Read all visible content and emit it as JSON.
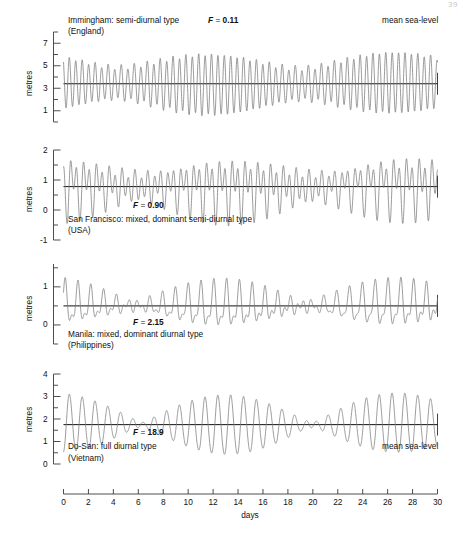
{
  "page": {
    "number": "39"
  },
  "figure": {
    "y_axis_label": "metres",
    "x_axis_label": "days",
    "x_ticks": [
      "0",
      "2",
      "4",
      "6",
      "8",
      "10",
      "12",
      "14",
      "16",
      "18",
      "20",
      "22",
      "24",
      "26",
      "28",
      "30"
    ],
    "mean_sea_level_label": "mean sea-level",
    "f_symbol": "F",
    "equals": "="
  },
  "chart_data": {
    "type": "line",
    "xlabel": "days",
    "ylabel": "metres",
    "xlim": [
      0,
      30
    ],
    "x_tick_step": 2,
    "grid": false,
    "legend": "none",
    "panels": [
      {
        "station": "Immingham",
        "country": "England",
        "tide_type": "semi-diurnal type",
        "caption_line1": "Immingham: semi-diurnal type",
        "caption_line2": "(England)",
        "f_label": "F",
        "f_value": "0.11",
        "f_numeric": 0.11,
        "ylim": [
          0,
          8
        ],
        "y_ticks_major": [
          1,
          3,
          5,
          7
        ],
        "y_ticks_minor": [
          0,
          2,
          4,
          6,
          8
        ],
        "y_tick_labels": [
          "1",
          "3",
          "5",
          "7"
        ],
        "mean_sea_level": 3.4,
        "show_msl_label": true,
        "harmonics": {
          "M2_amp": 2.05,
          "M2_period_hr": 12.4206,
          "M2_phase_deg": 20,
          "S2_amp": 0.62,
          "S2_period_hr": 12.0,
          "S2_phase_deg": 95,
          "K1_amp": 0.16,
          "K1_period_hr": 23.9345,
          "K1_phase_deg": 140,
          "O1_amp": 0.13,
          "O1_period_hr": 25.8193,
          "O1_phase_deg": 310,
          "Mm_amp": 0.1,
          "Mm_period_hr": 661.3,
          "Mm_phase_deg": 0
        },
        "range_note": "spring range ~5.3 m, neap range ~2.9 m"
      },
      {
        "station": "San Francisco",
        "country": "USA",
        "tide_type": "mixed, dominant semi-diurnal type",
        "caption_line1": "San Francisco: mixed, dominant semi-diurnal type",
        "caption_line2": "(USA)",
        "f_label": "F",
        "f_value": "0.90",
        "f_numeric": 0.9,
        "ylim": [
          -1,
          2
        ],
        "y_ticks_major": [
          -1,
          0,
          1,
          2
        ],
        "y_ticks_minor": [
          -0.5,
          0.5,
          1.5
        ],
        "y_tick_labels": [
          "-1",
          "0",
          "1",
          "2"
        ],
        "mean_sea_level": 0.78,
        "show_msl_label": false,
        "harmonics": {
          "M2_amp": 0.56,
          "M2_period_hr": 12.4206,
          "M2_phase_deg": 330,
          "S2_amp": 0.14,
          "S2_period_hr": 12.0,
          "S2_phase_deg": 355,
          "K1_amp": 0.37,
          "K1_period_hr": 23.9345,
          "K1_phase_deg": 95,
          "O1_amp": 0.23,
          "O1_period_hr": 25.8193,
          "O1_phase_deg": 75,
          "Mm_amp": 0.03,
          "Mm_period_hr": 661.3,
          "Mm_phase_deg": 0
        },
        "range_note": "two unequal highs and lows per day"
      },
      {
        "station": "Manila",
        "country": "Philippines",
        "tide_type": "mixed, dominant diurnal type",
        "caption_line1": "Manila: mixed, dominant diurnal type",
        "caption_line2": "(Philippines)",
        "f_label": "F",
        "f_value": "2.15",
        "f_numeric": 2.15,
        "ylim": [
          -0.5,
          1.6
        ],
        "y_ticks_major": [
          0,
          1
        ],
        "y_ticks_minor": [
          -0.5,
          0.5,
          1.5
        ],
        "y_tick_labels": [
          "0",
          "1"
        ],
        "mean_sea_level": 0.5,
        "show_msl_label": false,
        "harmonics": {
          "M2_amp": 0.17,
          "M2_period_hr": 12.4206,
          "M2_phase_deg": 250,
          "S2_amp": 0.07,
          "S2_period_hr": 12.0,
          "S2_phase_deg": 285,
          "K1_amp": 0.3,
          "K1_period_hr": 23.9345,
          "K1_phase_deg": 330,
          "O1_amp": 0.22,
          "O1_period_hr": 25.8193,
          "O1_phase_deg": 300,
          "Mm_amp": 0.02,
          "Mm_period_hr": 661.3,
          "Mm_phase_deg": 0
        },
        "range_note": "one dominant high per day, semi-diurnal at tropic minima"
      },
      {
        "station": "Do-San",
        "country": "Vietnam",
        "tide_type": "full diurnal type",
        "caption_line1": "Do-San: full diurnal type",
        "caption_line2": "(Vietnam)",
        "f_label": "F",
        "f_value": "18.9",
        "f_numeric": 18.9,
        "ylim": [
          0,
          4
        ],
        "y_ticks_major": [
          0,
          1,
          2,
          3,
          4
        ],
        "y_ticks_minor": [
          0.5,
          1.5,
          2.5,
          3.5
        ],
        "y_tick_labels": [
          "0",
          "1",
          "2",
          "3",
          "4"
        ],
        "mean_sea_level": 1.75,
        "show_msl_label": true,
        "harmonics": {
          "M2_amp": 0.04,
          "M2_period_hr": 12.4206,
          "M2_phase_deg": 60,
          "S2_amp": 0.02,
          "S2_period_hr": 12.0,
          "S2_phase_deg": 120,
          "K1_amp": 0.72,
          "K1_period_hr": 23.9345,
          "K1_phase_deg": 200,
          "O1_amp": 0.6,
          "O1_period_hr": 25.8193,
          "O1_phase_deg": 185,
          "Mm_amp": 0.04,
          "Mm_period_hr": 661.3,
          "Mm_phase_deg": 0
        },
        "range_note": "single high and low each day, strong tropic/equatorial modulation"
      }
    ]
  },
  "style": {
    "curve_color": "#7a7a7a",
    "msl_color": "#111111",
    "axis_color": "#3a3a3a",
    "text_color": "#111111"
  }
}
